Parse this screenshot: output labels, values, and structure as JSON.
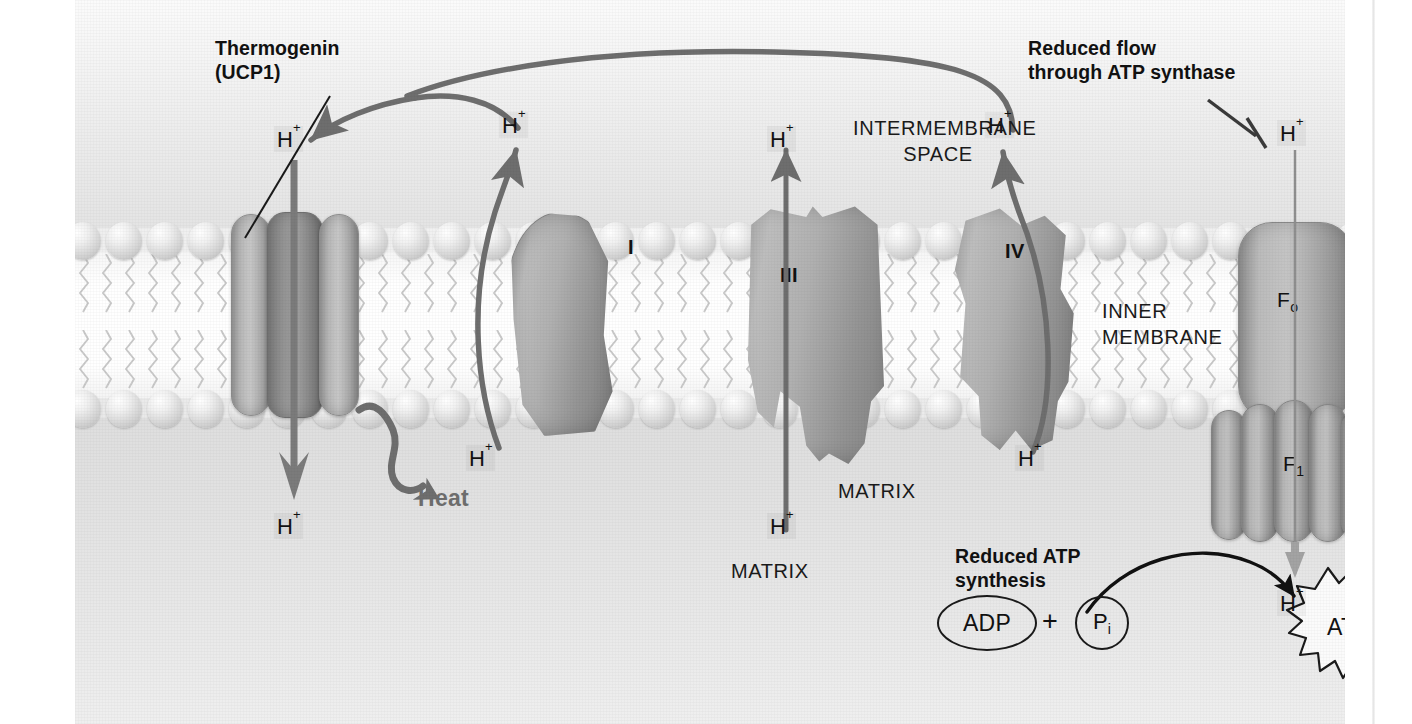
{
  "figure": {
    "kind": "mitochondrial-inner-membrane-uncoupling-diagram",
    "compartments": {
      "intermembrane_space": "INTERMEMBRANE\nSPACE",
      "inner_membrane": "INNER\nMEMBRANE",
      "matrix_center": "MATRIX",
      "matrix_lower": "MATRIX"
    },
    "callouts": {
      "thermogenin": "Thermogenin\n(UCP1)",
      "reduced_flow": "Reduced flow\nthrough ATP synthase",
      "reduced_synthesis": "Reduced ATP\nsynthesis"
    },
    "complex_labels": {
      "complex_I": "I",
      "complex_III": "III",
      "complex_IV": "IV",
      "f_o": "F",
      "f_o_sub": "o",
      "f_1": "F",
      "f_1_sub": "1"
    },
    "heat_label": "Heat",
    "proton": {
      "symbol": "H",
      "charge": "+"
    },
    "protons": [
      {
        "id": "h-thermogenin-top",
        "location": "intermembrane-space-above-thermogenin"
      },
      {
        "id": "h-thermogenin-matrix",
        "location": "matrix-below-thermogenin"
      },
      {
        "id": "h-complexI-top",
        "location": "intermembrane-space-above-complex-I"
      },
      {
        "id": "h-complexI-matrix",
        "location": "matrix-below-complex-I"
      },
      {
        "id": "h-complexIII-top",
        "location": "intermembrane-space-above-complex-III"
      },
      {
        "id": "h-complexIII-matrix",
        "location": "matrix-below-complex-III"
      },
      {
        "id": "h-complexIV-top",
        "location": "intermembrane-space-above-complex-IV"
      },
      {
        "id": "h-complexIV-matrix",
        "location": "matrix-below-complex-IV"
      },
      {
        "id": "h-atpsynthase-top",
        "location": "intermembrane-space-above-ATP-synthase"
      },
      {
        "id": "h-atpsynthase-matrix",
        "location": "matrix-below-ATP-synthase"
      }
    ],
    "molecules": {
      "adp": "ADP",
      "phosphate": "P",
      "phosphate_sub": "i",
      "plus": "+",
      "atp": "ATP"
    },
    "colors": {
      "text": "#111111",
      "arrow_gray": "#6e6e6e",
      "arrow_black": "#111111",
      "protein_fill": "#b0b0b0",
      "membrane_head": "#dcdcdc",
      "panel_bg": "#ececec"
    }
  }
}
